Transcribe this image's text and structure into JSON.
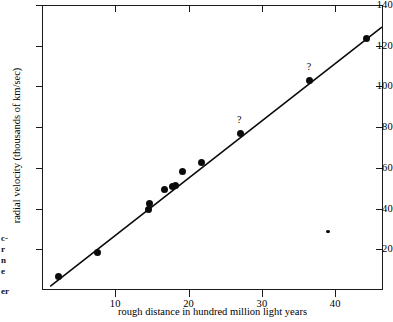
{
  "chart_data": {
    "type": "scatter",
    "title": "",
    "xlabel": "rough distance in hundred million light years",
    "ylabel": "radial velocity (thousands of km/sec)",
    "xlim": [
      0,
      46.5
    ],
    "ylim": [
      0,
      140
    ],
    "xticks": [
      10,
      20,
      30,
      40
    ],
    "yticks": [
      20,
      40,
      60,
      80,
      100,
      120,
      140
    ],
    "grid": false,
    "legend": "none",
    "points": [
      {
        "x": 2.2,
        "y": 6.5,
        "size": "large",
        "annotation": ""
      },
      {
        "x": 7.5,
        "y": 18.2,
        "size": "large",
        "annotation": ""
      },
      {
        "x": 14.5,
        "y": 39.5,
        "size": "large",
        "annotation": ""
      },
      {
        "x": 14.7,
        "y": 42.5,
        "size": "large",
        "annotation": ""
      },
      {
        "x": 16.7,
        "y": 49.3,
        "size": "large",
        "annotation": ""
      },
      {
        "x": 17.8,
        "y": 51.0,
        "size": "large",
        "annotation": ""
      },
      {
        "x": 18.2,
        "y": 51.3,
        "size": "large",
        "annotation": ""
      },
      {
        "x": 19.2,
        "y": 58.3,
        "size": "large",
        "annotation": ""
      },
      {
        "x": 21.7,
        "y": 62.5,
        "size": "large",
        "annotation": ""
      },
      {
        "x": 27.0,
        "y": 77.0,
        "size": "large",
        "annotation": "?"
      },
      {
        "x": 36.5,
        "y": 102.8,
        "size": "large",
        "annotation": "?"
      },
      {
        "x": 39.0,
        "y": 28.8,
        "size": "small",
        "annotation": ""
      },
      {
        "x": 44.2,
        "y": 123.3,
        "size": "large",
        "annotation": ""
      }
    ],
    "fit_line": {
      "label": "best-fit line",
      "x_start": 1.2,
      "y_start": 2.0,
      "x_end": 46.3,
      "y_end": 129.0
    },
    "annotations": [
      {
        "text": "?",
        "x": 27.0,
        "y": 83.5
      },
      {
        "text": "?",
        "x": 36.5,
        "y": 109.5
      }
    ]
  },
  "axes": {
    "y_tick_labels": [
      "140",
      "120",
      "100",
      "80",
      "60",
      "40",
      "20"
    ],
    "x_tick_labels": [
      "10",
      "20",
      "30",
      "40"
    ],
    "y_axis_title": "radial velocity (thousands of km/sec)",
    "x_axis_title": "rough distance in hundred million light years"
  },
  "page_margin_fragments": [
    {
      "text": "c-",
      "top": 234
    },
    {
      "text": "r",
      "top": 245
    },
    {
      "text": "n",
      "top": 256
    },
    {
      "text": "e",
      "top": 267
    },
    {
      "text": "er",
      "top": 287
    }
  ],
  "colors": {
    "ink": "#0b0b0b",
    "axis": "#1a1a1a",
    "background": "#ffffff"
  }
}
